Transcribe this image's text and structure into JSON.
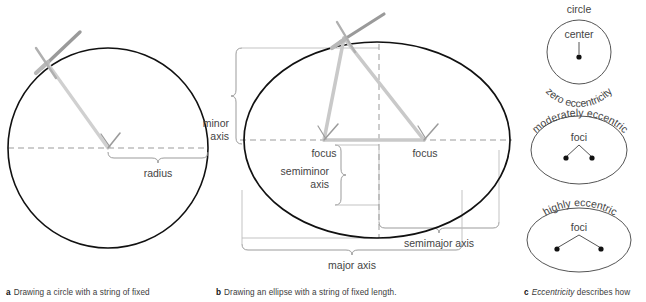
{
  "figure": {
    "title_implicit": "Circle and ellipse geometry: radius, foci, axes, eccentricity",
    "colors": {
      "outline": "#111111",
      "thin_line": "#9b9b9b",
      "brace": "#9b9b9b",
      "string": "#c9c9c9",
      "pencil": "#9a9a9a",
      "text": "#444444",
      "caption_text": "#3b3b3b",
      "background": "#ffffff"
    }
  },
  "panel_a": {
    "letter": "a",
    "caption": "Drawing a circle with a string of fixed",
    "labels": {
      "radius": "radius"
    },
    "geometry": {
      "circle_center_x": 108,
      "circle_center_y": 148,
      "circle_radius_x": 100,
      "circle_radius_y": 100
    }
  },
  "panel_b": {
    "letter": "b",
    "caption": "Drawing an ellipse with a string of fixed length.",
    "labels": {
      "minor_axis": "minor\naxis",
      "minor_axis_line1": "minor",
      "minor_axis_line2": "axis",
      "focus_left": "focus",
      "focus_right": "focus",
      "semiminor_axis_line1": "semiminor",
      "semiminor_axis_line2": "axis",
      "semimajor_axis": "semimajor axis",
      "major_axis": "major axis"
    },
    "geometry": {
      "ellipse_center_x": 165,
      "ellipse_center_y": 140,
      "ellipse_radius_x": 133,
      "ellipse_radius_y": 98,
      "focus_left_x": 112,
      "focus_right_x": 212
    }
  },
  "panel_c": {
    "letter": "c",
    "caption_italic": "Eccentricity",
    "caption_rest": "describes how",
    "items": [
      {
        "name": "circle",
        "top_label": "circle",
        "inner_label": "center",
        "curved_label": "zero eccentricity",
        "points": 1
      },
      {
        "name": "moderately-eccentric-ellipse",
        "top_label": "",
        "inner_label": "foci",
        "curved_label": "moderately eccentric",
        "points": 2
      },
      {
        "name": "highly-eccentric-ellipse",
        "top_label": "",
        "inner_label": "foci",
        "curved_label": "highly eccentric",
        "points": 2
      }
    ]
  }
}
